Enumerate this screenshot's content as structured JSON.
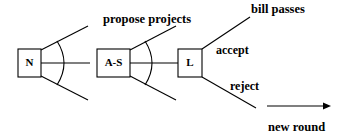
{
  "diagram": {
    "nodes": [
      {
        "id": "n",
        "label": "N",
        "name": "node-n"
      },
      {
        "id": "as",
        "label": "A-S",
        "name": "node-a-s"
      },
      {
        "id": "l",
        "label": "L",
        "name": "node-l"
      }
    ],
    "labels": {
      "propose_projects": "propose projects",
      "bill_passes": "bill passes",
      "accept": "accept",
      "reject": "reject",
      "new_round": "new round"
    },
    "colors": {
      "stroke": "#000000",
      "background": "#ffffff",
      "text": "#000000"
    }
  }
}
